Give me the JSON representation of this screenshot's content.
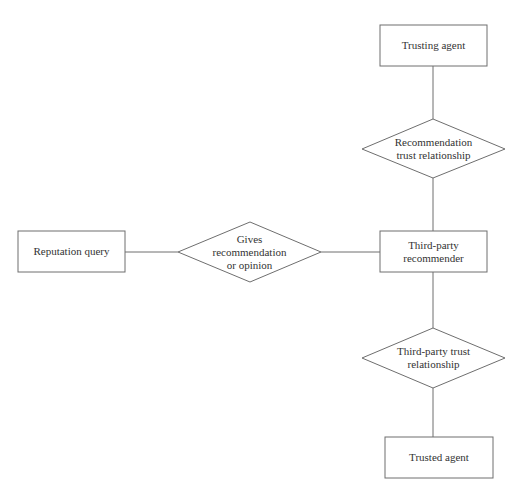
{
  "diagram": {
    "title": "",
    "colors": {
      "stroke": "#6e6e6e",
      "text": "#333333",
      "background": "#ffffff"
    },
    "nodes": {
      "trusting_agent": {
        "type": "rectangle",
        "label": "Trusting agent"
      },
      "recommendation_trust": {
        "type": "diamond",
        "line1": "Recommendation",
        "line2": "trust relationship"
      },
      "third_party_recommender": {
        "type": "rectangle",
        "line1": "Third-party",
        "line2": "recommender"
      },
      "reputation_query": {
        "type": "rectangle",
        "label": "Reputation query"
      },
      "gives_recommendation": {
        "type": "diamond",
        "line1": "Gives",
        "line2": "recommendation",
        "line3": "or opinion"
      },
      "third_party_trust": {
        "type": "diamond",
        "line1": "Third-party trust",
        "line2": "relationship"
      },
      "trusted_agent": {
        "type": "rectangle",
        "label": "Trusted agent"
      }
    },
    "edges": [
      {
        "from": "trusting_agent",
        "to": "recommendation_trust"
      },
      {
        "from": "recommendation_trust",
        "to": "third_party_recommender"
      },
      {
        "from": "reputation_query",
        "to": "gives_recommendation"
      },
      {
        "from": "gives_recommendation",
        "to": "third_party_recommender"
      },
      {
        "from": "third_party_recommender",
        "to": "third_party_trust"
      },
      {
        "from": "third_party_trust",
        "to": "trusted_agent"
      }
    ]
  }
}
